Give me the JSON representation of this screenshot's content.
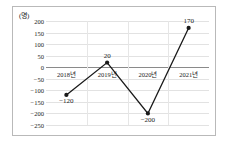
{
  "chart_data": {
    "type": "line",
    "title": "",
    "subtitle": "",
    "xlabel": "",
    "ylabel": "",
    "unit_label": "(명)",
    "categories": [
      "2018년",
      "2019년",
      "2020년",
      "2021년"
    ],
    "values": [
      -120,
      20,
      -200,
      170
    ],
    "point_labels": [
      "-120",
      "20",
      "-200",
      "170"
    ],
    "series": [
      {
        "name": "",
        "values": [
          -120,
          20,
          -200,
          170
        ]
      }
    ],
    "ylim": [
      -250,
      200
    ],
    "yticks": [
      200,
      150,
      100,
      50,
      0,
      -50,
      -100,
      -150,
      -200,
      -250
    ],
    "ytick_labels": [
      "200",
      "150",
      "100",
      "50",
      "0",
      "-50",
      "-100",
      "-150",
      "-200",
      "-250"
    ],
    "grid": true,
    "grid_orientation": "horizontal-and-vertical",
    "legend": false,
    "legend_position": "none",
    "marker": "filled-circle",
    "line_color": "#1a1a1a",
    "marker_color": "#1a1a1a",
    "grid_color": "#e2e2e2",
    "zero_line_color": "#8a8a8a",
    "border_color": "#b9b9b9",
    "background_color": "#ffffff"
  }
}
